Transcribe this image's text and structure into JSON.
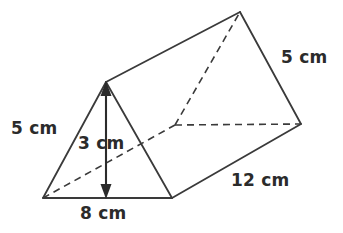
{
  "figure": {
    "name": "triangular-prism",
    "stroke_color": "#3a3a3a",
    "hidden_edge_color": "#3a3a3a",
    "background_color": "#ffffff",
    "label_color": "#2b2b2b"
  },
  "labels": {
    "slant_left": "5 cm",
    "height": "3 cm",
    "base": "8 cm",
    "slant_right": "5 cm",
    "depth": "12 cm"
  },
  "measurements": {
    "triangle_slant_side": 5,
    "triangle_height": 3,
    "triangle_base": 8,
    "prism_length": 12,
    "units": "cm"
  },
  "geometry": {
    "front_apex": [
      106,
      82
    ],
    "front_bottom_left": [
      43,
      198
    ],
    "front_bottom_right": [
      172,
      198
    ],
    "back_apex": [
      240,
      12
    ],
    "back_bottom_left": [
      175,
      125
    ],
    "back_bottom_right": [
      301,
      124
    ],
    "height_arrow": {
      "x": 106,
      "y_top": 84,
      "y_bottom": 197
    }
  }
}
